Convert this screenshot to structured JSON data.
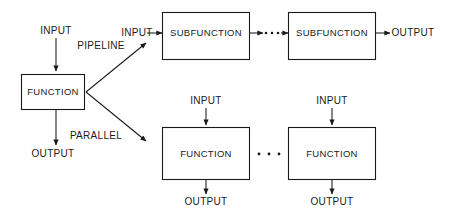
{
  "diagram": {
    "colors": {
      "stroke": "#1a1a1a",
      "fill": "#ffffff",
      "background": "#ffffff"
    },
    "source": {
      "box_label": "FUNCTION",
      "input_label": "INPUT",
      "output_label": "OUTPUT"
    },
    "branches": {
      "pipeline_label": "PIPELINE",
      "parallel_label": "PARALLEL"
    },
    "pipeline": {
      "input_label": "INPUT",
      "output_label": "OUTPUT",
      "ellipsis": "• • •",
      "stages": [
        {
          "label": "SUBFUNCTION"
        },
        {
          "label": "SUBFUNCTION"
        }
      ]
    },
    "parallel": {
      "ellipsis": "• • •",
      "branches": [
        {
          "label": "FUNCTION",
          "input_label": "INPUT",
          "output_label": "OUTPUT"
        },
        {
          "label": "FUNCTION",
          "input_label": "INPUT",
          "output_label": "OUTPUT"
        }
      ]
    }
  }
}
